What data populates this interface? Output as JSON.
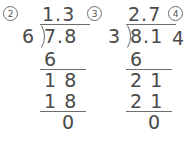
{
  "worksheet": {
    "problems": [
      {
        "number": "2",
        "divisor": "6",
        "dividend": "7.8",
        "quotient": "1.3",
        "steps": [
          {
            "value": "6",
            "rule_below": true
          },
          {
            "value": "1 8",
            "rule_below": false
          },
          {
            "value": "1 8",
            "rule_below": true
          }
        ],
        "remainder": "0"
      },
      {
        "number": "3",
        "divisor": "3",
        "dividend": "8.1",
        "quotient": "2.7",
        "steps": [
          {
            "value": "6",
            "rule_below": true
          },
          {
            "value": "2 1",
            "rule_below": false
          },
          {
            "value": "2 1",
            "rule_below": true
          }
        ],
        "remainder": "0"
      },
      {
        "number": "4",
        "partial_digit": "4"
      }
    ]
  },
  "colors": {
    "ink": "#4a4a4a",
    "rule": "#6e6e6e",
    "background": "#ffffff"
  }
}
